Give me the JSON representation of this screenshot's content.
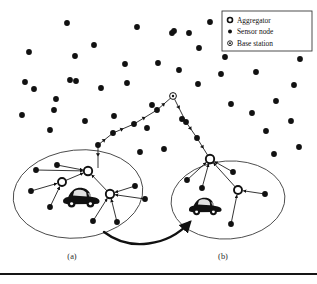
{
  "figure": {
    "background_color": "#ffffff",
    "ink_color": "#111111",
    "width": 317,
    "height": 284
  },
  "legend": {
    "box": {
      "x": 222,
      "y": 11,
      "width": 90,
      "height": 40
    },
    "border_color": "#3a3a3a",
    "items": [
      {
        "icon": "aggregator-icon",
        "label": "Aggregator"
      },
      {
        "icon": "sensor-node-icon",
        "label": "Sensor node"
      },
      {
        "icon": "base-station-icon",
        "label": "Base station"
      }
    ]
  },
  "panels": [
    {
      "id": "a",
      "label": "(a)",
      "label_x": 72,
      "label_y": 259
    },
    {
      "id": "b",
      "label": "(b)",
      "label_x": 223,
      "label_y": 259
    }
  ],
  "clusters": [
    {
      "id": "cluster-a",
      "cx": 78,
      "cy": 194,
      "rx": 65,
      "ry": 44,
      "rotation": -6
    },
    {
      "id": "cluster-b",
      "cx": 228,
      "cy": 200,
      "rx": 57,
      "ry": 39,
      "rotation": -4
    }
  ],
  "vehicles": [
    {
      "id": "vehicle-a",
      "x": 62,
      "y": 186,
      "width": 38,
      "height": 24
    },
    {
      "id": "vehicle-b",
      "x": 188,
      "y": 196,
      "width": 34,
      "height": 22
    }
  ],
  "base_station": {
    "id": "base-station",
    "x": 173,
    "y": 96,
    "radius": 3.4
  },
  "aggregators": [
    {
      "id": "aggregator-a1",
      "x": 88,
      "y": 171,
      "radius": 4.2
    },
    {
      "id": "aggregator-a2",
      "x": 62,
      "y": 182,
      "radius": 4.0
    },
    {
      "id": "aggregator-a3",
      "x": 110,
      "y": 194,
      "radius": 4.2
    },
    {
      "id": "aggregator-b1",
      "x": 210,
      "y": 159,
      "radius": 4.2
    },
    {
      "id": "aggregator-b2",
      "x": 238,
      "y": 190,
      "radius": 4.0
    }
  ],
  "sensor_nodes": [
    {
      "x": 67,
      "y": 23
    },
    {
      "x": 137,
      "y": 27
    },
    {
      "x": 172,
      "y": 33
    },
    {
      "x": 210,
      "y": 22
    },
    {
      "x": 94,
      "y": 45
    },
    {
      "x": 29,
      "y": 52
    },
    {
      "x": 75,
      "y": 56
    },
    {
      "x": 174,
      "y": 31
    },
    {
      "x": 25,
      "y": 82
    },
    {
      "x": 76,
      "y": 81
    },
    {
      "x": 125,
      "y": 64
    },
    {
      "x": 158,
      "y": 63
    },
    {
      "x": 189,
      "y": 33
    },
    {
      "x": 225,
      "y": 57
    },
    {
      "x": 199,
      "y": 48
    },
    {
      "x": 70,
      "y": 80
    },
    {
      "x": 34,
      "y": 89
    },
    {
      "x": 56,
      "y": 99
    },
    {
      "x": 101,
      "y": 88
    },
    {
      "x": 127,
      "y": 83
    },
    {
      "x": 179,
      "y": 70
    },
    {
      "x": 198,
      "y": 84
    },
    {
      "x": 221,
      "y": 74
    },
    {
      "x": 253,
      "y": 47
    },
    {
      "x": 256,
      "y": 72
    },
    {
      "x": 272,
      "y": 34
    },
    {
      "x": 289,
      "y": 22
    },
    {
      "x": 276,
      "y": 101
    },
    {
      "x": 294,
      "y": 85
    },
    {
      "x": 300,
      "y": 59
    },
    {
      "x": 22,
      "y": 115
    },
    {
      "x": 50,
      "y": 130
    },
    {
      "x": 54,
      "y": 110
    },
    {
      "x": 85,
      "y": 121
    },
    {
      "x": 114,
      "y": 116
    },
    {
      "x": 147,
      "y": 128
    },
    {
      "x": 152,
      "y": 105
    },
    {
      "x": 182,
      "y": 119
    },
    {
      "x": 231,
      "y": 104
    },
    {
      "x": 252,
      "y": 113
    },
    {
      "x": 266,
      "y": 131
    },
    {
      "x": 291,
      "y": 121
    },
    {
      "x": 299,
      "y": 147
    },
    {
      "x": 164,
      "y": 149
    },
    {
      "x": 140,
      "y": 152
    },
    {
      "x": 274,
      "y": 154
    },
    {
      "x": 36,
      "y": 170
    },
    {
      "x": 57,
      "y": 165
    },
    {
      "x": 31,
      "y": 191
    },
    {
      "x": 50,
      "y": 207
    },
    {
      "x": 93,
      "y": 221
    },
    {
      "x": 117,
      "y": 222
    },
    {
      "x": 135,
      "y": 186
    },
    {
      "x": 145,
      "y": 199
    },
    {
      "x": 187,
      "y": 180
    },
    {
      "x": 202,
      "y": 188
    },
    {
      "x": 233,
      "y": 172
    },
    {
      "x": 265,
      "y": 194
    },
    {
      "x": 231,
      "y": 224
    }
  ],
  "relay_chain": {
    "id": "relay-chain",
    "description": "Multi-hop path from cluster aggregators to the base station",
    "left_branch": [
      {
        "x": 98,
        "y": 145
      },
      {
        "x": 113,
        "y": 133
      },
      {
        "x": 134,
        "y": 124
      },
      {
        "x": 157,
        "y": 110
      },
      {
        "x": 173,
        "y": 96
      }
    ],
    "right_branch": [
      {
        "x": 173,
        "y": 96
      },
      {
        "x": 186,
        "y": 122
      },
      {
        "x": 197,
        "y": 138
      },
      {
        "x": 210,
        "y": 159
      }
    ],
    "stub": [
      {
        "x": 98,
        "y": 145
      },
      {
        "x": 98,
        "y": 168
      }
    ]
  },
  "links": {
    "cluster_a": [
      {
        "from": [
          36,
          170
        ],
        "to": [
          88,
          171
        ]
      },
      {
        "from": [
          57,
          165
        ],
        "to": [
          88,
          171
        ]
      },
      {
        "from": [
          62,
          182
        ],
        "to": [
          88,
          171
        ]
      },
      {
        "from": [
          31,
          191
        ],
        "to": [
          62,
          182
        ]
      },
      {
        "from": [
          50,
          207
        ],
        "to": [
          62,
          182
        ]
      },
      {
        "from": [
          110,
          194
        ],
        "to": [
          88,
          171
        ]
      },
      {
        "from": [
          135,
          186
        ],
        "to": [
          110,
          194
        ]
      },
      {
        "from": [
          145,
          199
        ],
        "to": [
          110,
          194
        ]
      },
      {
        "from": [
          93,
          221
        ],
        "to": [
          110,
          194
        ]
      },
      {
        "from": [
          117,
          222
        ],
        "to": [
          110,
          194
        ]
      }
    ],
    "cluster_b": [
      {
        "from": [
          187,
          180
        ],
        "to": [
          210,
          159
        ]
      },
      {
        "from": [
          202,
          188
        ],
        "to": [
          210,
          159
        ]
      },
      {
        "from": [
          233,
          172
        ],
        "to": [
          210,
          159
        ]
      },
      {
        "from": [
          238,
          190
        ],
        "to": [
          210,
          159
        ]
      },
      {
        "from": [
          265,
          194
        ],
        "to": [
          238,
          190
        ]
      },
      {
        "from": [
          231,
          224
        ],
        "to": [
          238,
          190
        ]
      }
    ]
  },
  "transfer_arrow": {
    "id": "transfer-arrow",
    "description": "Curved arrow indicating movement from cluster (a) to cluster (b)",
    "path": "M 104 232 C 130 252 168 246 190 222"
  },
  "bottom_rule": {
    "y": 274,
    "thickness": 2.2,
    "color": "#151515"
  }
}
